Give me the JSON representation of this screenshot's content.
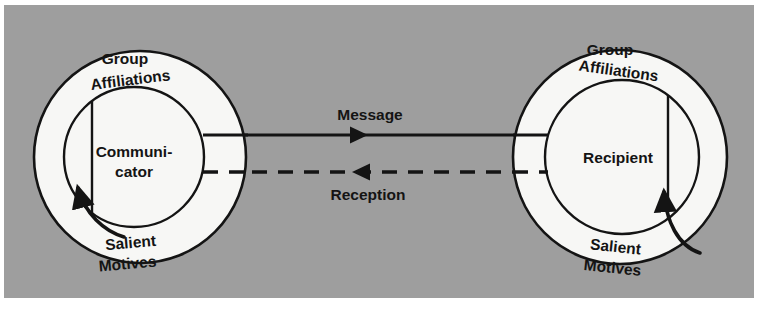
{
  "figure": {
    "background_color": "#9e9e9e",
    "page_color": "#ffffff",
    "ink_color": "#141414",
    "node_fill": "#f7f7f5"
  },
  "nodes": [
    {
      "id": "communicator",
      "core_label": "Communi-",
      "core_label_line2": "cator",
      "ring_label_top_line1": "Group",
      "ring_label_top_line2": "Affiliations",
      "ring_label_bottom_line1": "Salient",
      "ring_label_bottom_line2": "Motives"
    },
    {
      "id": "recipient",
      "core_label": "Recipient",
      "core_label_line2": "",
      "ring_label_top_line1": "Group",
      "ring_label_top_line2": "Affiliations",
      "ring_label_bottom_line1": "Salient",
      "ring_label_bottom_line2": "Motives"
    }
  ],
  "flows": [
    {
      "id": "message",
      "label": "Message",
      "direction": "left-to-right",
      "line_style": "solid"
    },
    {
      "id": "reception",
      "label": "Reception",
      "direction": "right-to-left",
      "line_style": "dashed"
    }
  ]
}
